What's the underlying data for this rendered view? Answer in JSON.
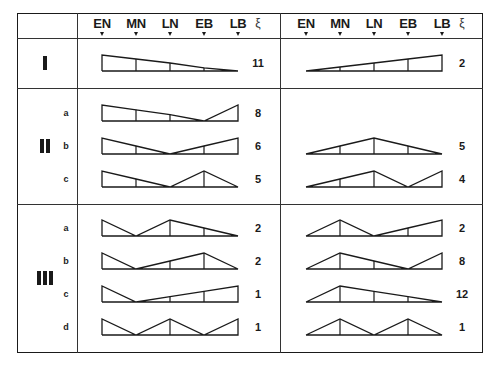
{
  "header": {
    "left_columns": [
      "EN",
      "MN",
      "LN",
      "EB",
      "LB"
    ],
    "right_columns": [
      "EN",
      "MN",
      "LN",
      "EB",
      "LB"
    ],
    "value_symbol": "ξ"
  },
  "groups": [
    {
      "label": "I",
      "rows": [
        {
          "sub": "",
          "left": {
            "heights": [
              1,
              0.75,
              0.5,
              0.2,
              0
            ],
            "value": "11"
          },
          "right": {
            "heights": [
              0,
              0.25,
              0.5,
              0.75,
              1
            ],
            "value": "2"
          }
        }
      ]
    },
    {
      "label": "II",
      "rows": [
        {
          "sub": "a",
          "left": {
            "heights": [
              1,
              0.7,
              0.4,
              0,
              1
            ],
            "value": "8"
          },
          "right": null
        },
        {
          "sub": "b",
          "left": {
            "heights": [
              1,
              0.5,
              0,
              0.5,
              1
            ],
            "value": "6"
          },
          "right": {
            "heights": [
              0,
              0.5,
              1,
              0.5,
              0
            ],
            "value": "5"
          }
        },
        {
          "sub": "c",
          "left": {
            "heights": [
              1,
              0.5,
              0,
              1,
              0
            ],
            "value": "5"
          },
          "right": {
            "heights": [
              0,
              0.5,
              1,
              0,
              1
            ],
            "value": "4"
          }
        }
      ]
    },
    {
      "label": "III",
      "rows": [
        {
          "sub": "a",
          "left": {
            "heights": [
              1,
              0,
              1,
              0.5,
              0
            ],
            "value": "2"
          },
          "right": {
            "heights": [
              0,
              1,
              0,
              0.5,
              1
            ],
            "value": "2"
          }
        },
        {
          "sub": "b",
          "left": {
            "heights": [
              1,
              0,
              0.5,
              1,
              0
            ],
            "value": "2"
          },
          "right": {
            "heights": [
              0,
              1,
              0.5,
              0,
              1
            ],
            "value": "8"
          }
        },
        {
          "sub": "c",
          "left": {
            "heights": [
              1,
              0,
              0.33,
              0.67,
              1
            ],
            "value": "1"
          },
          "right": {
            "heights": [
              0,
              1,
              0.67,
              0.33,
              0
            ],
            "value": "12"
          }
        },
        {
          "sub": "d",
          "left": {
            "heights": [
              1,
              0,
              1,
              0,
              1
            ],
            "value": "1"
          },
          "right": {
            "heights": [
              0,
              1,
              0,
              1,
              0
            ],
            "value": "1"
          }
        }
      ]
    }
  ]
}
